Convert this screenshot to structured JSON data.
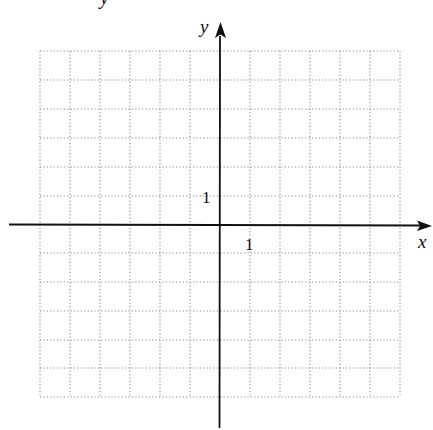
{
  "diagram": {
    "type": "coordinate_grid",
    "x_axis_label": "x",
    "y_axis_label": "y",
    "x_tick_label": "1",
    "y_tick_label": "1",
    "top_clipped_label": "y",
    "grid": {
      "x_range": [
        -6,
        6
      ],
      "y_range": [
        -6,
        6
      ],
      "unit": 1,
      "style": "dotted"
    },
    "colors": {
      "axis": "#111111",
      "grid": "#888888",
      "background": "#ffffff"
    }
  }
}
